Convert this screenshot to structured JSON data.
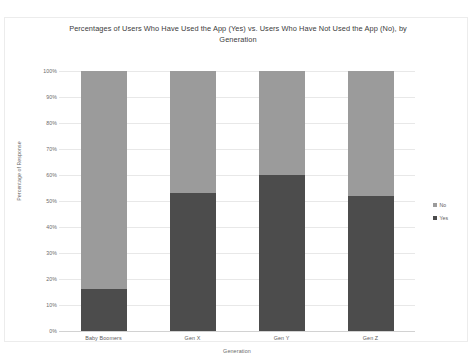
{
  "chart_data": {
    "type": "bar",
    "subtype": "stacked-100-percent",
    "title": "Percentages of Users Who Have Used the  App (Yes) vs. Users Who Have Not Used the App (No), by Generation",
    "xlabel": "Generation",
    "ylabel": "Percentage of Response",
    "categories": [
      "Baby Boomers",
      "Gen X",
      "Gen Y",
      "Gen Z"
    ],
    "series": [
      {
        "name": "No",
        "values": [
          84,
          47,
          40,
          48
        ],
        "color": "#9b9b9b"
      },
      {
        "name": "Yes",
        "values": [
          16,
          53,
          60,
          52
        ],
        "color": "#4c4c4c"
      }
    ],
    "ylim": [
      0,
      100
    ],
    "yticks": [
      "0%",
      "10%",
      "20%",
      "30%",
      "40%",
      "50%",
      "60%",
      "70%",
      "80%",
      "90%",
      "100%"
    ],
    "ytick_values": [
      0,
      10,
      20,
      30,
      40,
      50,
      60,
      70,
      80,
      90,
      100
    ],
    "grid": true,
    "legend_position": "right",
    "legend_entries": [
      {
        "label": "No",
        "color": "#9b9b9b"
      },
      {
        "label": "Yes",
        "color": "#4c4c4c"
      }
    ]
  }
}
